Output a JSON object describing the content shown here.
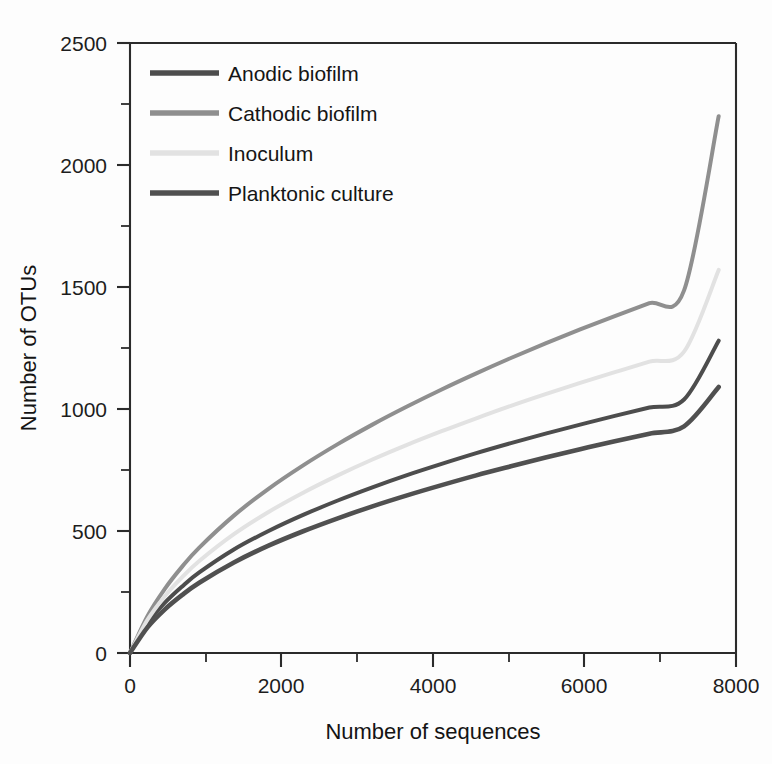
{
  "chart_data": {
    "type": "line",
    "title": "",
    "subtitle": "",
    "xlabel": "Number of sequences",
    "ylabel": "Number of OTUs",
    "xlim": [
      0,
      8750
    ],
    "ylim": [
      0,
      2500
    ],
    "x_ticks": [
      0,
      2000,
      4000,
      6000,
      8000
    ],
    "x_tick_labels": [
      "0",
      "2000",
      "4000",
      "6000",
      "8000"
    ],
    "x_minor_step": 1000,
    "y_ticks": [
      0,
      500,
      1000,
      1500,
      2000,
      2500
    ],
    "y_tick_labels": [
      "0",
      "500",
      "1000",
      "1500",
      "2000",
      "2500"
    ],
    "y_minor_step": 250,
    "grid": false,
    "legend_position": "upper-left-inside",
    "x": [
      0,
      250,
      500,
      750,
      1000,
      1500,
      2000,
      2500,
      3000,
      3500,
      4000,
      4500,
      5000,
      5500,
      6000,
      6500,
      7000,
      7500,
      8000,
      8500
    ],
    "series": [
      {
        "name": "Anodic biofilm",
        "color": "#4d4d4d",
        "width": 4.0,
        "values": [
          0,
          120,
          205,
          272,
          330,
          424,
          500,
          566,
          625,
          679,
          729,
          775,
          819,
          860,
          899,
          936,
          972,
          1006,
          1039,
          1280
        ]
      },
      {
        "name": "Cathodic biofilm",
        "color": "#8f8f8f",
        "width": 4.0,
        "values": [
          0,
          150,
          262,
          353,
          432,
          563,
          673,
          769,
          856,
          936,
          1010,
          1080,
          1146,
          1209,
          1269,
          1326,
          1381,
          1434,
          1486,
          2200
        ]
      },
      {
        "name": "Inoculum",
        "color": "#e2e2e2",
        "width": 4.0,
        "values": [
          0,
          135,
          232,
          310,
          377,
          487,
          578,
          657,
          728,
          793,
          853,
          909,
          962,
          1013,
          1061,
          1107,
          1151,
          1194,
          1235,
          1570
        ]
      },
      {
        "name": "Planktonic culture",
        "color": "#505050",
        "width": 4.6,
        "values": [
          0,
          104,
          178,
          237,
          288,
          371,
          440,
          499,
          552,
          601,
          646,
          688,
          728,
          765,
          801,
          835,
          868,
          899,
          929,
          1090
        ]
      }
    ]
  },
  "legend": {
    "items": [
      {
        "label": "Anodic biofilm",
        "color": "#4d4d4d"
      },
      {
        "label": "Cathodic biofilm",
        "color": "#8f8f8f"
      },
      {
        "label": "Inoculum",
        "color": "#e2e2e2"
      },
      {
        "label": "Planktonic culture",
        "color": "#505050"
      }
    ]
  },
  "axes": {
    "x_title": "Number of sequences",
    "y_title": "Number of OTUs",
    "x_tick_0": "0",
    "x_tick_1": "2000",
    "x_tick_2": "4000",
    "x_tick_3": "6000",
    "x_tick_4": "8000",
    "y_tick_0": "0",
    "y_tick_1": "500",
    "y_tick_2": "1000",
    "y_tick_3": "1500",
    "y_tick_4": "2000",
    "y_tick_5": "2500"
  }
}
